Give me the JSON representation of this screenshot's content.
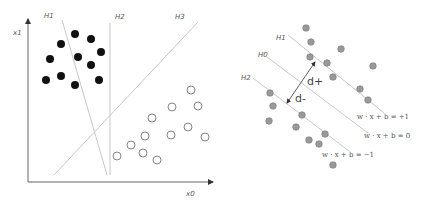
{
  "left_panel": {
    "axes": {
      "y_label": "x1",
      "x_label": "x0"
    },
    "hyperplanes": [
      {
        "label": "H1",
        "x1": 62,
        "y1": 20,
        "x2": 107,
        "y2": 175
      },
      {
        "label": "H2",
        "x1": 110,
        "y1": 23,
        "x2": 110,
        "y2": 175
      },
      {
        "label": "H3",
        "x1": 198,
        "y1": 22,
        "x2": 54,
        "y2": 175
      }
    ],
    "labels": {
      "h1": "H1",
      "h2": "H2",
      "h3": "H3"
    },
    "class_filled": [
      [
        75,
        34
      ],
      [
        91,
        39
      ],
      [
        61,
        44
      ],
      [
        101,
        52
      ],
      [
        50,
        59
      ],
      [
        78,
        57
      ],
      [
        91,
        65
      ],
      [
        46,
        80
      ],
      [
        61,
        76
      ],
      [
        75,
        85
      ],
      [
        99,
        80
      ]
    ],
    "class_open": [
      [
        191,
        90
      ],
      [
        172,
        107
      ],
      [
        198,
        106
      ],
      [
        152,
        118
      ],
      [
        145,
        136
      ],
      [
        171,
        135
      ],
      [
        188,
        127
      ],
      [
        205,
        137
      ],
      [
        131,
        145
      ],
      [
        143,
        153
      ],
      [
        117,
        156
      ],
      [
        157,
        160
      ]
    ]
  },
  "right_panel": {
    "labels": {
      "h1": "H1",
      "h0": "H0",
      "h2": "H2",
      "d_plus": "d+",
      "d_minus": "d-"
    },
    "equations": {
      "plus": "w · x + b = +1",
      "zero": "w · x + b = 0",
      "minus": "w · x + b = −1"
    },
    "points": [
      [
        306,
        28
      ],
      [
        311,
        42
      ],
      [
        341,
        49
      ],
      [
        310,
        57
      ],
      [
        327,
        63
      ],
      [
        373,
        66
      ],
      [
        333,
        77
      ],
      [
        360,
        89
      ],
      [
        368,
        100
      ],
      [
        270,
        93
      ],
      [
        273,
        106
      ],
      [
        269,
        121
      ],
      [
        302,
        115
      ],
      [
        296,
        127
      ],
      [
        325,
        134
      ],
      [
        309,
        140
      ],
      [
        319,
        144
      ],
      [
        333,
        165
      ]
    ],
    "colors": {
      "point_fill": "#999999",
      "point_stroke": "#7a7a7a",
      "line": "#c8c8c8"
    }
  }
}
